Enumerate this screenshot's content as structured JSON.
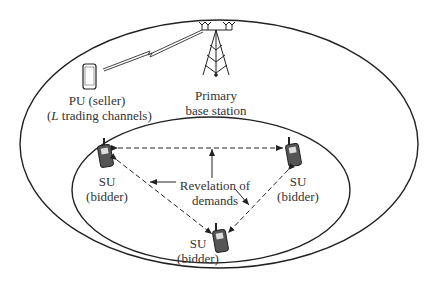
{
  "diagram": {
    "nodes": {
      "pu": {
        "line1": "PU (seller)",
        "line2_prefix": "(",
        "line2_var": "L",
        "line2_rest": " trading channels)"
      },
      "bs": {
        "line1": "Primary",
        "line2": "base station"
      },
      "su_left": {
        "line1": "SU",
        "line2": "(bidder)"
      },
      "su_right": {
        "line1": "SU",
        "line2": "(bidder)"
      },
      "su_bottom": {
        "line1": "SU",
        "line2": "(bidder)"
      }
    },
    "annotation": {
      "line1": "Revelation of",
      "line2": "demands"
    },
    "edges": [
      {
        "from": "su_left",
        "to": "su_right",
        "style": "dashed",
        "arrows": "both"
      },
      {
        "from": "su_left",
        "to": "su_bottom",
        "style": "dashed",
        "arrows": "both"
      },
      {
        "from": "su_right",
        "to": "su_bottom",
        "style": "dashed",
        "arrows": "both"
      },
      {
        "from": "pu",
        "to": "bs",
        "style": "wireless-link"
      }
    ],
    "regions": [
      "primary-network-coverage",
      "secondary-network"
    ]
  }
}
